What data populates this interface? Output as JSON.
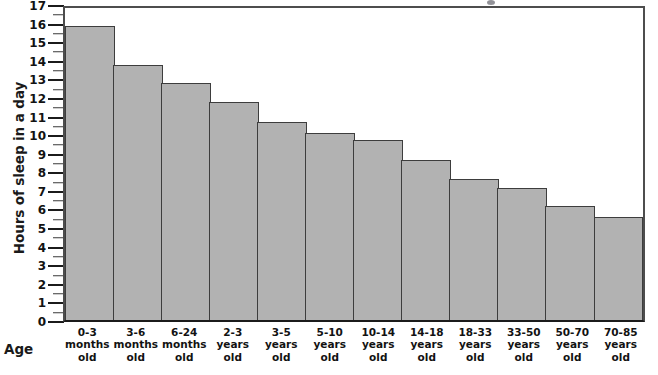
{
  "chart_data": {
    "type": "bar",
    "title": "",
    "xlabel": "Age",
    "ylabel": "Hours of sleep in a day",
    "ylim": [
      0,
      17
    ],
    "ytick_step": 1,
    "minor_tick_step": 0.5,
    "grid": false,
    "legend": null,
    "bar_color": "#b2b2b2",
    "bar_border_color": "#3d3d3d",
    "axis_color": "#1b1b1b",
    "categories": [
      "0-3 months old",
      "3-6 months old",
      "6-24 months old",
      "2-3 years old",
      "3-5 years old",
      "5-10 years old",
      "10-14 years old",
      "14-18 years old",
      "18-33 years old",
      "33-50 years old",
      "50-70 years old",
      "70-85 years old"
    ],
    "category_lines": [
      [
        "0-3",
        "months",
        "old"
      ],
      [
        "3-6",
        "months",
        "old"
      ],
      [
        "6-24",
        "months",
        "old"
      ],
      [
        "2-3",
        "years",
        "old"
      ],
      [
        "3-5",
        "years",
        "old"
      ],
      [
        "5-10",
        "years",
        "old"
      ],
      [
        "10-14",
        "years",
        "old"
      ],
      [
        "14-18",
        "years",
        "old"
      ],
      [
        "18-33",
        "years",
        "old"
      ],
      [
        "33-50",
        "years",
        "old"
      ],
      [
        "50-70",
        "years",
        "old"
      ],
      [
        "70-85",
        "years",
        "old"
      ]
    ],
    "values": [
      16.0,
      13.9,
      12.9,
      11.9,
      10.8,
      10.2,
      9.8,
      8.7,
      7.7,
      7.2,
      6.2,
      5.6
    ],
    "ytick_labels": [
      "0",
      "1",
      "2",
      "3",
      "4",
      "5",
      "6",
      "7",
      "8",
      "9",
      "10",
      "11",
      "12",
      "13",
      "14",
      "15",
      "16",
      "17"
    ]
  }
}
